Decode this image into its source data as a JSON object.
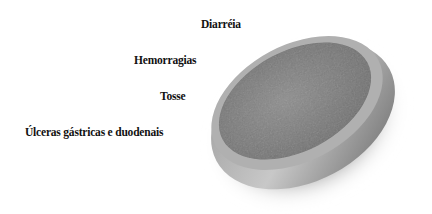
{
  "figure": {
    "labels": [
      "Diarréia",
      "Hemorragias",
      "Tosse",
      "Úlceras gástricas e duodenais"
    ],
    "image": "gray-tablet-disc"
  },
  "colors": {
    "text": "#111111",
    "disc_face": "#7a7a7a",
    "disc_rim": "#b5b5b5",
    "background": "#ffffff"
  }
}
